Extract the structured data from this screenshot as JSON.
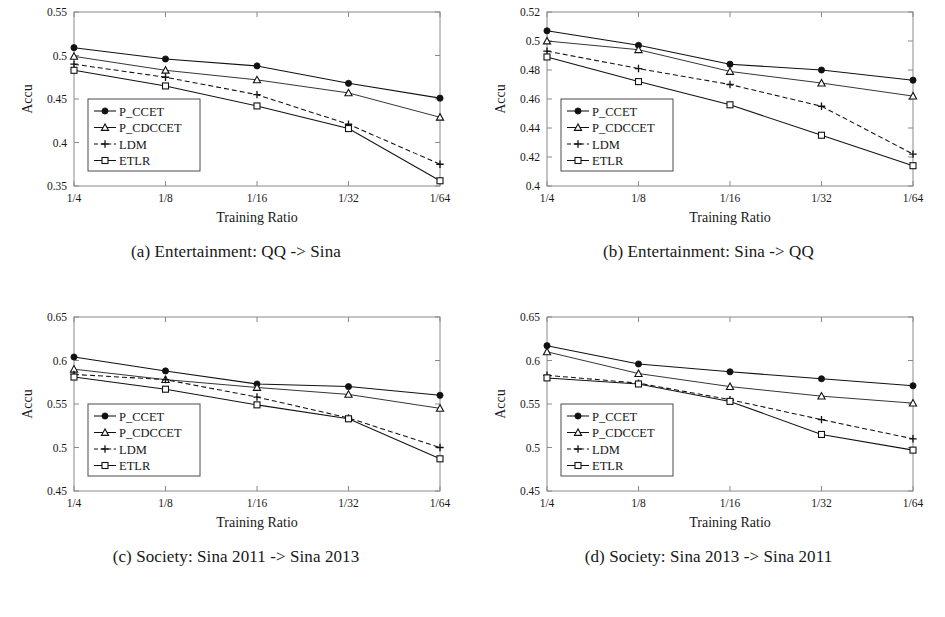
{
  "figure": {
    "axis_x_title": "Training Ratio",
    "axis_y_title": "Accu",
    "categories": [
      "1/4",
      "1/8",
      "1/16",
      "1/32",
      "1/64"
    ],
    "series_names": [
      "P_CCET",
      "P_CDCCET",
      "LDM",
      "ETLR"
    ],
    "markers": [
      "filled-circle",
      "open-triangle",
      "plus",
      "open-square"
    ],
    "line_styles": [
      "solid",
      "solid",
      "dashed",
      "solid"
    ],
    "line_color": "#111111",
    "frame_color": "#8a8a8a",
    "background": "#ffffff"
  },
  "panels": [
    {
      "caption": "(a) Entertainment: QQ -> Sina"
    },
    {
      "caption": "(b) Entertainment: Sina -> QQ"
    },
    {
      "caption": "(c) Society: Sina 2011 -> Sina 2013"
    },
    {
      "caption": "(d) Society: Sina 2013 -> Sina 2011"
    }
  ],
  "chart_data": [
    {
      "type": "line",
      "title": "(a) Entertainment: QQ -> Sina",
      "xlabel": "Training Ratio",
      "ylabel": "Accu",
      "categories": [
        "1/4",
        "1/8",
        "1/16",
        "1/32",
        "1/64"
      ],
      "ylim": [
        0.35,
        0.55
      ],
      "yticks": [
        0.35,
        0.4,
        0.45,
        0.5,
        0.55
      ],
      "ytick_labels": [
        "0.35",
        "0.4",
        "0.45",
        "0.5",
        "0.55"
      ],
      "grid": false,
      "legend_position": "lower-left",
      "series": [
        {
          "name": "P_CCET",
          "values": [
            0.509,
            0.496,
            0.488,
            0.468,
            0.451
          ]
        },
        {
          "name": "P_CDCCET",
          "values": [
            0.499,
            0.483,
            0.472,
            0.457,
            0.429
          ]
        },
        {
          "name": "LDM",
          "values": [
            0.49,
            0.475,
            0.455,
            0.421,
            0.375
          ]
        },
        {
          "name": "ETLR",
          "values": [
            0.483,
            0.465,
            0.442,
            0.416,
            0.356
          ]
        }
      ]
    },
    {
      "type": "line",
      "title": "(b) Entertainment: Sina -> QQ",
      "xlabel": "Training Ratio",
      "ylabel": "Accu",
      "categories": [
        "1/4",
        "1/8",
        "1/16",
        "1/32",
        "1/64"
      ],
      "ylim": [
        0.4,
        0.52
      ],
      "yticks": [
        0.4,
        0.42,
        0.44,
        0.46,
        0.48,
        0.5,
        0.52
      ],
      "ytick_labels": [
        "0.4",
        "0.42",
        "0.44",
        "0.46",
        "0.48",
        "0.5",
        "0.52"
      ],
      "grid": false,
      "legend_position": "lower-left",
      "series": [
        {
          "name": "P_CCET",
          "values": [
            0.507,
            0.497,
            0.484,
            0.48,
            0.473
          ]
        },
        {
          "name": "P_CDCCET",
          "values": [
            0.5,
            0.494,
            0.479,
            0.471,
            0.462
          ]
        },
        {
          "name": "LDM",
          "values": [
            0.493,
            0.481,
            0.47,
            0.455,
            0.422
          ]
        },
        {
          "name": "ETLR",
          "values": [
            0.489,
            0.472,
            0.456,
            0.435,
            0.414
          ]
        }
      ]
    },
    {
      "type": "line",
      "title": "(c) Society: Sina 2011 -> Sina 2013",
      "xlabel": "Training Ratio",
      "ylabel": "Accu",
      "categories": [
        "1/4",
        "1/8",
        "1/16",
        "1/32",
        "1/64"
      ],
      "ylim": [
        0.45,
        0.65
      ],
      "yticks": [
        0.45,
        0.5,
        0.55,
        0.6,
        0.65
      ],
      "ytick_labels": [
        "0.45",
        "0.5",
        "0.55",
        "0.6",
        "0.65"
      ],
      "grid": false,
      "legend_position": "lower-left",
      "series": [
        {
          "name": "P_CCET",
          "values": [
            0.604,
            0.588,
            0.573,
            0.57,
            0.56
          ]
        },
        {
          "name": "P_CDCCET",
          "values": [
            0.59,
            0.578,
            0.569,
            0.561,
            0.545
          ]
        },
        {
          "name": "LDM",
          "values": [
            0.584,
            0.578,
            0.558,
            0.534,
            0.5
          ]
        },
        {
          "name": "ETLR",
          "values": [
            0.581,
            0.567,
            0.549,
            0.533,
            0.487
          ]
        }
      ]
    },
    {
      "type": "line",
      "title": "(d) Society: Sina 2013 -> Sina 2011",
      "xlabel": "Training Ratio",
      "ylabel": "Accu",
      "categories": [
        "1/4",
        "1/8",
        "1/16",
        "1/32",
        "1/64"
      ],
      "ylim": [
        0.45,
        0.65
      ],
      "yticks": [
        0.45,
        0.5,
        0.55,
        0.6,
        0.65
      ],
      "ytick_labels": [
        "0.45",
        "0.5",
        "0.55",
        "0.6",
        "0.65"
      ],
      "grid": false,
      "legend_position": "lower-left",
      "series": [
        {
          "name": "P_CCET",
          "values": [
            0.617,
            0.596,
            0.587,
            0.579,
            0.571
          ]
        },
        {
          "name": "P_CDCCET",
          "values": [
            0.61,
            0.585,
            0.57,
            0.559,
            0.551
          ]
        },
        {
          "name": "LDM",
          "values": [
            0.583,
            0.574,
            0.555,
            0.532,
            0.51
          ]
        },
        {
          "name": "ETLR",
          "values": [
            0.58,
            0.573,
            0.553,
            0.515,
            0.497
          ]
        }
      ]
    }
  ]
}
